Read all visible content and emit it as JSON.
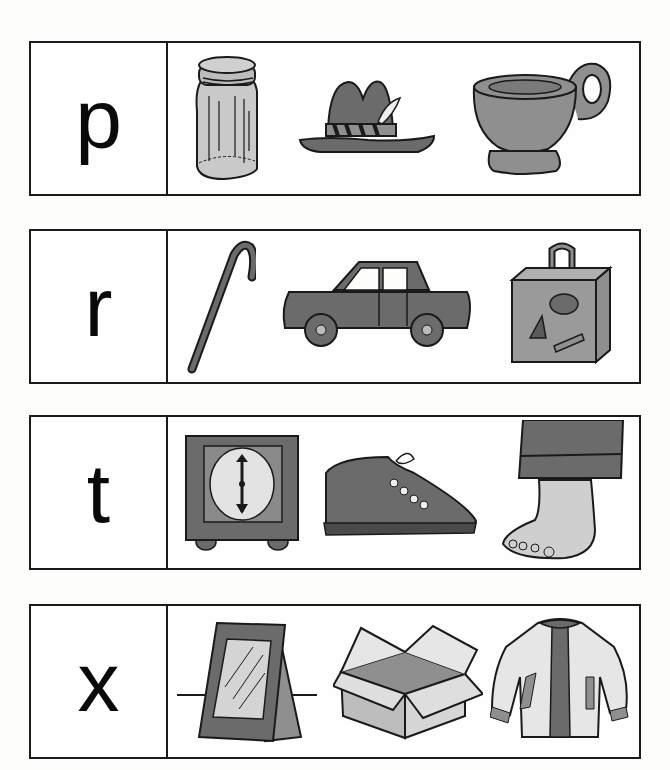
{
  "worksheet": {
    "rows": [
      {
        "letter": "p",
        "pictures": [
          {
            "label": "jar"
          },
          {
            "label": "hat"
          },
          {
            "label": "cup"
          }
        ]
      },
      {
        "letter": "r",
        "pictures": [
          {
            "label": "cane"
          },
          {
            "label": "car"
          },
          {
            "label": "suitcase"
          }
        ]
      },
      {
        "letter": "t",
        "pictures": [
          {
            "label": "clock"
          },
          {
            "label": "shoe"
          },
          {
            "label": "foot"
          }
        ]
      },
      {
        "letter": "x",
        "pictures": [
          {
            "label": "frame"
          },
          {
            "label": "box"
          },
          {
            "label": "jacket"
          }
        ]
      }
    ]
  },
  "colors": {
    "ink": "#1a1a1a",
    "dark_fill": "#6b6b6b",
    "mid_fill": "#8f8f8f",
    "light_fill": "#c9c9c9",
    "paper": "#fdfdfc"
  }
}
